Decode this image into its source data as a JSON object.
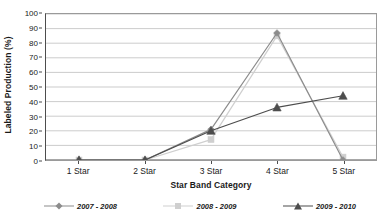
{
  "chart_data": {
    "type": "line",
    "title": "",
    "xlabel": "Star Band Category",
    "ylabel": "Labeled Production (%)",
    "categories": [
      "1 Star",
      "2 Star",
      "3 Star",
      "4 Star",
      "5 Star"
    ],
    "ylim": [
      0,
      100
    ],
    "ytick_step": 10,
    "yticks": [
      0,
      10,
      20,
      30,
      40,
      50,
      60,
      70,
      80,
      90,
      100
    ],
    "ytick_labels": [
      "0",
      "10",
      "20",
      "30",
      "40",
      "50",
      "60",
      "70",
      "80",
      "90",
      "100"
    ],
    "grid": "horizontal",
    "legend_position": "bottom",
    "series": [
      {
        "name": "2007 - 2008",
        "marker": "diamond",
        "color": "#8c8c8c",
        "line_color": "#8c8c8c",
        "values": [
          0,
          0,
          21,
          87,
          0
        ]
      },
      {
        "name": "2008 - 2009",
        "marker": "square",
        "color": "#cfcfcf",
        "line_color": "#cfcfcf",
        "values": [
          0,
          0,
          14,
          85,
          2
        ]
      },
      {
        "name": "2009 - 2010",
        "marker": "triangle",
        "color": "#4d4d4d",
        "line_color": "#4d4d4d",
        "values": [
          0,
          0,
          20,
          36,
          44
        ]
      }
    ]
  },
  "colors": {
    "axis": "#4d4d4d",
    "grid": "#b5b5b5",
    "plot_border": "#9a9a9a",
    "background": "#ffffff",
    "text": "#1a1a1a"
  }
}
